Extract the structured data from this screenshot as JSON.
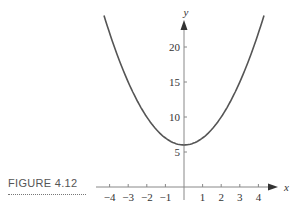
{
  "figure": {
    "caption": "FIGURE 4.12"
  },
  "chart_data": {
    "type": "line",
    "title": "",
    "function": "y = x^2 + 6",
    "xlabel": "x",
    "ylabel": "y",
    "x_ticks": [
      -4,
      -3,
      -2,
      -1,
      1,
      2,
      3,
      4
    ],
    "y_ticks": [
      5,
      10,
      15,
      20
    ],
    "xlim": [
      -4.3,
      4.3
    ],
    "ylim": [
      0,
      24
    ],
    "grid": false,
    "series": [
      {
        "name": "parabola",
        "x": [
          -4,
          -3,
          -2,
          -1,
          0,
          1,
          2,
          3,
          4
        ],
        "values": [
          22,
          15,
          10,
          7,
          6,
          7,
          10,
          15,
          22
        ]
      }
    ],
    "color": "#555555"
  }
}
